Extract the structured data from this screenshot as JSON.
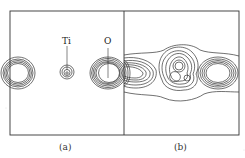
{
  "figure": {
    "panels": [
      {
        "id": "a",
        "label": "(a)"
      },
      {
        "id": "b",
        "label": "(b)"
      }
    ],
    "atom_labels": {
      "ti": "Ti",
      "o": "O"
    }
  }
}
